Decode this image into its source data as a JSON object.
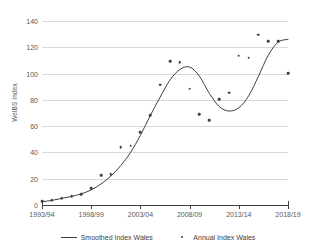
{
  "chart_data": {
    "type": "line",
    "title": "",
    "xlabel": "",
    "ylabel": "WelBS Index",
    "ylim": [
      0,
      140
    ],
    "ytick_values": [
      0,
      20,
      40,
      60,
      80,
      100,
      120,
      140
    ],
    "ytick_labels": [
      "0",
      "20",
      "40",
      "60",
      "80",
      "100",
      "120",
      "140"
    ],
    "grid": true,
    "legend_position": "bottom",
    "x_categories": [
      "1993/94",
      "1994/95",
      "1995/96",
      "1996/97",
      "1997/98",
      "1998/99",
      "1999/00",
      "2000/01",
      "2001/02",
      "2002/03",
      "2003/04",
      "2004/05",
      "2005/06",
      "2006/07",
      "2007/08",
      "2008/09",
      "2009/10",
      "2010/11",
      "2011/12",
      "2012/13",
      "2013/14",
      "2014/15",
      "2015/16",
      "2016/17",
      "2017/18",
      "2018/19"
    ],
    "xtick_labels": [
      "1993/94",
      "1998/99",
      "2003/04",
      "2008/09",
      "2013/14",
      "2018/19"
    ],
    "xtick_indices": [
      0,
      5,
      10,
      15,
      20,
      25
    ],
    "series": [
      {
        "name": "Smoothed Index Wales",
        "type": "line",
        "color": "#404040",
        "values": [
          2.5,
          3.5,
          5.0,
          6.5,
          8.5,
          11.5,
          16.0,
          22.0,
          30.0,
          40.0,
          53.0,
          68.0,
          82.0,
          95.0,
          103.0,
          105.0,
          98.0,
          85.0,
          75.0,
          71.5,
          74.0,
          83.0,
          98.0,
          114.0,
          124.0,
          126.0
        ]
      },
      {
        "name": "Annual Index Wales",
        "type": "scatter",
        "color": "#404040",
        "values": [
          3.0,
          3.5,
          5.0,
          6.5,
          8.0,
          13.0,
          22.5,
          23.5,
          44.0,
          45.0,
          55.5,
          68.5,
          91.5,
          109.5,
          108.5,
          88.5,
          69.0,
          64.5,
          80.5,
          85.5,
          113.5,
          112.0,
          129.5,
          124.5,
          124.5,
          100.5
        ]
      }
    ]
  },
  "legend": {
    "entries": [
      {
        "label": "Smoothed Index Wales",
        "marker": "line"
      },
      {
        "label": "Annual Index Wales",
        "marker": "dot"
      }
    ]
  },
  "axis": {
    "y_title": "WelBS Index"
  },
  "colors": {
    "series": "#404040",
    "gridline": "#d9d9d9",
    "axis": "#404040",
    "tick_text": "#595959",
    "background": "#ffffff"
  }
}
